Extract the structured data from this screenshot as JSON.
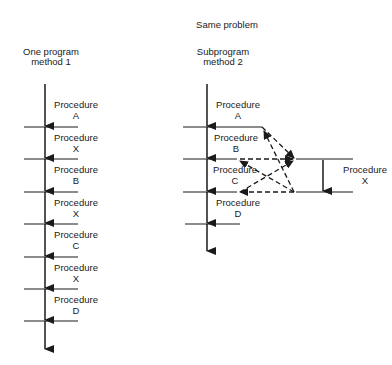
{
  "title": "Same problem",
  "left": {
    "heading_line1": "One program",
    "heading_line2": "method 1",
    "procedures": [
      {
        "line1": "Procedure",
        "line2": "A"
      },
      {
        "line1": "Procedure",
        "line2": "X"
      },
      {
        "line1": "Procedure",
        "line2": "B"
      },
      {
        "line1": "Procedure",
        "line2": "X"
      },
      {
        "line1": "Procedure",
        "line2": "C"
      },
      {
        "line1": "Procedure",
        "line2": "X"
      },
      {
        "line1": "Procedure",
        "line2": "D"
      }
    ]
  },
  "right": {
    "heading_line1": "Subprogram",
    "heading_line2": "method 2",
    "procedures": [
      {
        "line1": "Procedure",
        "line2": "A"
      },
      {
        "line1": "Procedure",
        "line2": "B"
      },
      {
        "line1": "Procedure",
        "line2": "C"
      },
      {
        "line1": "Procedure",
        "line2": "D"
      }
    ],
    "subprogram": {
      "line1": "Procedure",
      "line2": "X"
    }
  },
  "colors": {
    "ink": "#1a1a1a",
    "background": "#ffffff"
  }
}
